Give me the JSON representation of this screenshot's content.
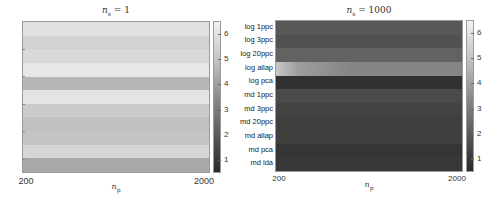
{
  "chart_data": [
    {
      "type": "heatmap",
      "title": "n_s = 1",
      "xlabel": "n_p",
      "ylabel": "",
      "x_ticks": [
        "200",
        "2000"
      ],
      "y_categories": [
        "log 1ppc",
        "log 3ppc",
        "log 20ppc",
        "log allap",
        "log pca",
        "md 1ppc",
        "md 3ppc",
        "md 20ppc",
        "md allap",
        "md pca",
        "md lda"
      ],
      "y_tick_labels_visible": false,
      "values_per_row": [
        5.9,
        5.5,
        5.7,
        6.1,
        4.7,
        6.0,
        5.3,
        5.0,
        5.1,
        5.6,
        4.3
      ],
      "colorbar": {
        "min": 0.5,
        "max": 6.5,
        "ticks": [
          "1",
          "2",
          "3",
          "4",
          "5",
          "6"
        ]
      },
      "colormap": "gray"
    },
    {
      "type": "heatmap",
      "title": "n_s = 1000",
      "xlabel": "n_p",
      "ylabel": "",
      "x_ticks": [
        "200",
        "2000"
      ],
      "y_categories": [
        "log 1ppc",
        "log 3ppc",
        "log 20ppc",
        "log allap",
        "log pca",
        "md 1ppc",
        "md 3ppc",
        "md 20ppc",
        "md allap",
        "md pca",
        "md lda"
      ],
      "y_tick_labels_visible": true,
      "values_per_row": [
        2.0,
        1.8,
        2.3,
        3.3,
        0.9,
        1.6,
        1.4,
        1.3,
        1.3,
        1.0,
        1.1
      ],
      "row_notes": {
        "log allap": "brighter (~5) near n_p = 200, fading to ~3 by 2000"
      },
      "colorbar": {
        "min": 0.5,
        "max": 6.5,
        "ticks": [
          "1",
          "2",
          "3",
          "4",
          "5",
          "6"
        ]
      },
      "colormap": "gray"
    }
  ],
  "left": {
    "title_main": "n",
    "title_sub": "s",
    "title_rest": " = 1",
    "x_tick_left": "200",
    "x_tick_right": "2000",
    "xlabel_main": "n",
    "xlabel_sub": "p"
  },
  "right": {
    "title_main": "n",
    "title_sub": "s",
    "title_rest": " = 1000",
    "x_tick_left": "200",
    "x_tick_right": "2000",
    "xlabel_main": "n",
    "xlabel_sub": "p"
  },
  "colorbar_ticks": [
    "6",
    "5",
    "4",
    "3",
    "2",
    "1"
  ]
}
